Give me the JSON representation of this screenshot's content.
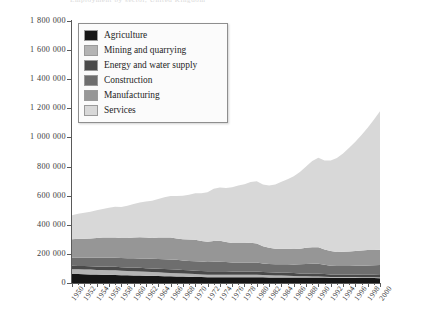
{
  "figure": {
    "top_bleed_text": "Employment by sector, United Kingdom",
    "background_color": "#ffffff"
  },
  "legend": {
    "position": "top-left-inside",
    "items": [
      {
        "label": "Agriculture",
        "color": "#161616",
        "swatch_name": "legend-swatch-agriculture"
      },
      {
        "label": "Mining and quarrying",
        "color": "#b4b4b4",
        "swatch_name": "legend-swatch-mining-and-quarrying"
      },
      {
        "label": "Energy and water supply",
        "color": "#4a4a4a",
        "swatch_name": "legend-swatch-energy-and-water-supply"
      },
      {
        "label": "Construction",
        "color": "#6e6e6e",
        "swatch_name": "legend-swatch-construction"
      },
      {
        "label": "Manufacturing",
        "color": "#969696",
        "swatch_name": "legend-swatch-manufacturing"
      },
      {
        "label": "Services",
        "color": "#d8d8d8",
        "swatch_name": "legend-swatch-services"
      }
    ]
  },
  "axes": {
    "y_tick_labels": [
      "1 800 000",
      "1 600 000",
      "1 400 000",
      "1 200 000",
      "1 000 000",
      "800 000",
      "600 000",
      "400 000",
      "200 000",
      "0"
    ],
    "y_tick_values": [
      1800000,
      1600000,
      1400000,
      1200000,
      1000000,
      800000,
      600000,
      400000,
      200000,
      0
    ],
    "x_tick_labels": [
      "1950",
      "1952",
      "1954",
      "1956",
      "1958",
      "1960",
      "1962",
      "1964",
      "1966",
      "1968",
      "1970",
      "1972",
      "1974",
      "1976",
      "1978",
      "1980",
      "1982",
      "1984",
      "1986",
      "1988",
      "1990",
      "1992",
      "1994",
      "1996",
      "1998",
      "2000"
    ]
  },
  "chart_data": {
    "type": "area",
    "title": "",
    "subtitle": "",
    "xlabel": "",
    "ylabel": "",
    "stacked": true,
    "grid": false,
    "legend_position": "top-left-inside",
    "xlim": [
      1950,
      2000
    ],
    "ylim": [
      0,
      1800000
    ],
    "x": [
      1950,
      1951,
      1952,
      1953,
      1954,
      1955,
      1956,
      1957,
      1958,
      1959,
      1960,
      1961,
      1962,
      1963,
      1964,
      1965,
      1966,
      1967,
      1968,
      1969,
      1970,
      1971,
      1972,
      1973,
      1974,
      1975,
      1976,
      1977,
      1978,
      1979,
      1980,
      1981,
      1982,
      1983,
      1984,
      1985,
      1986,
      1987,
      1988,
      1989,
      1990,
      1991,
      1992,
      1993,
      1994,
      1995,
      1996,
      1997,
      1998,
      1999,
      2000
    ],
    "series": [
      {
        "name": "Agriculture",
        "color": "#161616",
        "values": [
          62000,
          61000,
          60000,
          59000,
          58000,
          57000,
          56000,
          55000,
          54000,
          53000,
          52000,
          51000,
          50000,
          49000,
          48000,
          47000,
          46000,
          45000,
          44000,
          43000,
          42000,
          41000,
          40000,
          40000,
          40000,
          40000,
          40000,
          40000,
          40000,
          40000,
          40000,
          39000,
          38000,
          38000,
          38000,
          38000,
          38000,
          38000,
          38000,
          38000,
          38000,
          37000,
          36000,
          36000,
          36000,
          36000,
          36000,
          35000,
          35000,
          34000,
          33000
        ]
      },
      {
        "name": "Mining and quarrying",
        "color": "#b4b4b4",
        "values": [
          33000,
          33000,
          33000,
          33000,
          32000,
          32000,
          32000,
          32000,
          31000,
          30000,
          29000,
          28000,
          27000,
          26000,
          25000,
          24000,
          23000,
          22000,
          21000,
          20000,
          19000,
          18000,
          17000,
          17000,
          17000,
          17000,
          17000,
          17000,
          17000,
          17000,
          17000,
          16000,
          15000,
          14000,
          13000,
          12000,
          10000,
          9000,
          8000,
          7000,
          7000,
          6000,
          6000,
          5000,
          5000,
          5000,
          5000,
          5000,
          5000,
          5000,
          5000
        ]
      },
      {
        "name": "Energy and water supply",
        "color": "#4a4a4a",
        "values": [
          23000,
          23000,
          23000,
          23000,
          24000,
          24000,
          24000,
          24000,
          24000,
          24000,
          25000,
          25000,
          25000,
          25000,
          25000,
          25000,
          25000,
          25000,
          24000,
          24000,
          24000,
          24000,
          23000,
          23000,
          23000,
          23000,
          22000,
          22000,
          22000,
          22000,
          22000,
          21000,
          21000,
          20000,
          20000,
          20000,
          20000,
          19000,
          19000,
          18000,
          18000,
          18000,
          17000,
          17000,
          17000,
          17000,
          17000,
          17000,
          17000,
          17000,
          17000
        ]
      },
      {
        "name": "Construction",
        "color": "#6e6e6e",
        "values": [
          55000,
          56000,
          57000,
          58000,
          59000,
          60000,
          61000,
          62000,
          62000,
          63000,
          64000,
          65000,
          66000,
          66000,
          67000,
          68000,
          68000,
          67000,
          66000,
          65000,
          65000,
          64000,
          64000,
          66000,
          66000,
          64000,
          62000,
          61000,
          61000,
          62000,
          62000,
          58000,
          56000,
          56000,
          57000,
          58000,
          59000,
          62000,
          66000,
          70000,
          70000,
          64000,
          60000,
          58000,
          58000,
          59000,
          60000,
          62000,
          64000,
          66000,
          68000
        ]
      },
      {
        "name": "Manufacturing",
        "color": "#969696",
        "values": [
          128000,
          131000,
          131000,
          133000,
          136000,
          139000,
          140000,
          140000,
          138000,
          139000,
          143000,
          145000,
          145000,
          144000,
          147000,
          149000,
          150000,
          146000,
          145000,
          146000,
          147000,
          142000,
          139000,
          142000,
          144000,
          138000,
          134000,
          135000,
          135000,
          135000,
          130000,
          118000,
          112000,
          108000,
          108000,
          108000,
          107000,
          108000,
          111000,
          113000,
          112000,
          105000,
          100000,
          97000,
          98000,
          100000,
          102000,
          104000,
          105000,
          104000,
          105000
        ]
      },
      {
        "name": "Services",
        "color": "#d8d8d8",
        "values": [
          165000,
          172000,
          178000,
          184000,
          191000,
          197000,
          204000,
          210000,
          213000,
          221000,
          230000,
          239000,
          247000,
          255000,
          265000,
          276000,
          286000,
          292000,
          300000,
          309000,
          320000,
          327000,
          340000,
          360000,
          366000,
          370000,
          382000,
          394000,
          404000,
          418000,
          428000,
          424000,
          428000,
          440000,
          459000,
          477000,
          499000,
          527000,
          559000,
          592000,
          615000,
          611000,
          622000,
          645000,
          676000,
          712000,
          750000,
          793000,
          840000,
          895000,
          952000
        ]
      }
    ]
  }
}
